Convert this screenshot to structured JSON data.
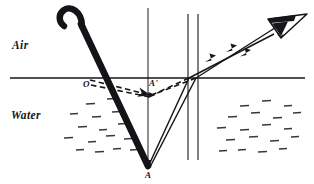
{
  "figure": {
    "type": "optics-ray-diagram",
    "width": 314,
    "height": 184,
    "background_color": "#ffffff",
    "ink_color": "#16161a"
  },
  "labels": {
    "air": "Air",
    "water": "Water",
    "point_o": "O",
    "point_a_prime": "A'",
    "point_a": "A"
  },
  "regions": [
    {
      "name": "air",
      "label": "Air",
      "position": "above-surface"
    },
    {
      "name": "water",
      "label": "Water",
      "position": "below-surface"
    }
  ],
  "geometry": {
    "surface_line": {
      "x1": 10,
      "y1": 78,
      "x2": 305,
      "y2": 78
    },
    "vertical_normal_through_a": {
      "x": 148,
      "y1": 8,
      "y2": 160
    },
    "vertical_guide_left": {
      "x": 188,
      "y1": 14,
      "y2": 160
    },
    "vertical_guide_right": {
      "x": 198,
      "y1": 14,
      "y2": 160
    },
    "stick": {
      "entry_point_o": {
        "x": 88,
        "y": 78
      },
      "submerged_tip_a": {
        "x": 148,
        "y": 168
      },
      "handle_hook_top": {
        "x": 72,
        "y": 10
      }
    },
    "apparent_image_a_prime": {
      "x": 152,
      "y": 95
    },
    "eye": {
      "x": 285,
      "y": 24
    }
  },
  "elements": [
    {
      "name": "stick",
      "description": "walking stick with curved hook handle, entering water at O and ending at A"
    },
    {
      "name": "real-rays",
      "description": "two solid rays from A refracting at the surface toward the eye"
    },
    {
      "name": "virtual-rays",
      "description": "two dashed back-projected rays meeting at apparent point A'"
    },
    {
      "name": "apparent-stick",
      "description": "dashed segment from O to A' showing the apparent bent stick"
    },
    {
      "name": "eye",
      "description": "observer's eye viewing the refracted rays"
    },
    {
      "name": "water-texture",
      "description": "short horizontal dashes indicating water"
    }
  ],
  "ray_arrows": [
    {
      "name": "upper-ray-arrow",
      "x": 232,
      "y": 47
    },
    {
      "name": "lower-ray-arrow",
      "x": 212,
      "y": 56
    }
  ]
}
